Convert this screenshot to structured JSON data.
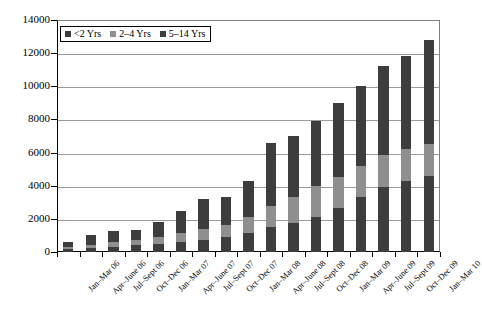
{
  "chart_data": {
    "type": "bar",
    "stacked": true,
    "title": "",
    "xlabel": "",
    "ylabel": "",
    "ylim": [
      0,
      14000
    ],
    "ytick_step": 2000,
    "yticks": [
      "0",
      "2000",
      "4000",
      "6000",
      "8000",
      "10000",
      "12000",
      "14000"
    ],
    "grid": true,
    "legend_position": "top-left-inside",
    "categories": [
      "Jan–Mar 06",
      "Apr–June 06",
      "Jul–Sept 06",
      "Oct–Dec 06",
      "Jan–Mar 07",
      "Apr–June 07",
      "Jul–Sept 07",
      "Oct–Dec 07",
      "Jan–Mar 08",
      "Apr–June 08",
      "Jul–Sept 08",
      "Oct–Dec 08",
      "Jan–Mar 09",
      "Apr–June 09",
      "Jul–Sept 09",
      "Oct–Dec 09",
      "Jan–Mar 10"
    ],
    "series": [
      {
        "name": "<2 Yrs",
        "color": "#3d3d3d",
        "values": [
          180,
          250,
          330,
          400,
          500,
          620,
          750,
          900,
          1150,
          1500,
          1750,
          2100,
          2650,
          3300,
          3950,
          4300,
          4600
        ]
      },
      {
        "name": "2–4 Yrs",
        "color": "#8f8f8f",
        "values": [
          120,
          180,
          250,
          300,
          400,
          500,
          620,
          750,
          950,
          1300,
          1550,
          1900,
          1900,
          1900,
          1900,
          1900,
          1900
        ]
      },
      {
        "name": "5–14 Yrs",
        "color": "#3d3d3d",
        "values": [
          300,
          570,
          670,
          600,
          900,
          1380,
          1830,
          1650,
          2200,
          3800,
          3700,
          3900,
          4450,
          4800,
          5350,
          5600,
          6300
        ]
      }
    ],
    "totals": [
      600,
      1000,
      1250,
      1300,
      1800,
      2500,
      3200,
      3300,
      4300,
      6600,
      7000,
      7900,
      9000,
      10000,
      11200,
      11800,
      12800
    ]
  },
  "legend": {
    "items": [
      {
        "label": "<2 Yrs",
        "color": "#3d3d3d"
      },
      {
        "label": "2–4 Yrs",
        "color": "#8f8f8f"
      },
      {
        "label": "5–14 Yrs",
        "color": "#3d3d3d"
      }
    ]
  },
  "colors": {
    "young": "#3d3d3d",
    "mid": "#8f8f8f",
    "old": "#3d3d3d",
    "grid": "#9a9a9a",
    "axis": "#000000",
    "background": "#ffffff"
  }
}
